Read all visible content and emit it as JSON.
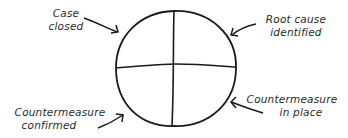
{
  "diagram": {
    "type": "four-quadrant-cycle",
    "labels": {
      "top_left": [
        "Case",
        "closed"
      ],
      "top_right": [
        "Root cause",
        "identified"
      ],
      "bottom_left": [
        "Countermeasure",
        "confirmed"
      ],
      "bottom_right": [
        "Countermeasure",
        "in place"
      ]
    },
    "colors": {
      "stroke": "#1a1a1a",
      "text": "#2a2a2a",
      "background": "#ffffff"
    }
  }
}
